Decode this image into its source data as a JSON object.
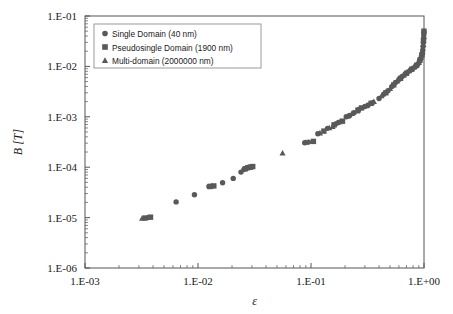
{
  "chart_data": {
    "type": "scatter",
    "title": "",
    "xlabel": "ε",
    "ylabel": "B [T]",
    "xscale": "log",
    "yscale": "log",
    "xlim": [
      0.001,
      1
    ],
    "ylim": [
      1e-06,
      0.1
    ],
    "xticklabels": [
      "1.E-03",
      "1.E-02",
      "1.E-01",
      "1.E+00"
    ],
    "xtickvalues": [
      0.001,
      0.01,
      0.1,
      1
    ],
    "yticklabels": [
      "1.E-01",
      "1.E-02",
      "1.E-03",
      "1.E-04",
      "1.E-05",
      "1.E-06"
    ],
    "ytickvalues": [
      0.1,
      0.01,
      0.001,
      0.0001,
      1e-05,
      1e-06
    ],
    "grid": false,
    "minor_ticks": true,
    "legend_position": "top-left",
    "marker_color": "#595959",
    "frame_color": "#555555",
    "background": "#ffffff",
    "series": [
      {
        "name": "Single Domain (40 nm)",
        "marker": "circle",
        "points": [
          [
            0.0036,
            1e-05
          ],
          [
            0.0064,
            2.05e-05
          ],
          [
            0.0093,
            2.85e-05
          ],
          [
            0.0125,
            4.15e-05
          ],
          [
            0.0132,
            4.2e-05
          ],
          [
            0.0165,
            4.9e-05
          ],
          [
            0.0205,
            6e-05
          ],
          [
            0.024,
            8e-05
          ],
          [
            0.0255,
            9e-05
          ],
          [
            0.027,
            9.6e-05
          ],
          [
            0.0285,
            0.0001
          ],
          [
            0.03,
            0.000102
          ],
          [
            0.088,
            0.000305
          ],
          [
            0.095,
            0.000315
          ],
          [
            0.115,
            0.00046
          ],
          [
            0.14,
            0.00059
          ],
          [
            0.165,
            0.00072
          ],
          [
            0.175,
            0.00077
          ],
          [
            0.205,
            0.001
          ],
          [
            0.22,
            0.00106
          ],
          [
            0.24,
            0.0012
          ],
          [
            0.265,
            0.0014
          ],
          [
            0.3,
            0.0016
          ],
          [
            0.32,
            0.0017
          ],
          [
            0.35,
            0.0019
          ],
          [
            0.4,
            0.0023
          ],
          [
            0.44,
            0.0028
          ],
          [
            0.48,
            0.0033
          ],
          [
            0.52,
            0.004
          ],
          [
            0.56,
            0.0048
          ],
          [
            0.6,
            0.0055
          ],
          [
            0.64,
            0.0063
          ],
          [
            0.68,
            0.007
          ],
          [
            0.72,
            0.0078
          ],
          [
            0.76,
            0.0085
          ],
          [
            0.8,
            0.0092
          ],
          [
            0.84,
            0.01
          ],
          [
            0.88,
            0.011
          ],
          [
            0.91,
            0.0125
          ],
          [
            0.93,
            0.014
          ],
          [
            0.95,
            0.016
          ],
          [
            0.965,
            0.018
          ],
          [
            0.975,
            0.021
          ],
          [
            0.982,
            0.025
          ],
          [
            0.988,
            0.03
          ],
          [
            0.993,
            0.036
          ],
          [
            0.996,
            0.042
          ],
          [
            0.998,
            0.047
          ]
        ]
      },
      {
        "name": "Pseudosingle Domain (1900 nm)",
        "marker": "square",
        "points": [
          [
            0.0034,
            9.8e-06
          ],
          [
            0.0038,
            1.02e-05
          ],
          [
            0.0128,
            4.15e-05
          ],
          [
            0.0138,
            4.25e-05
          ],
          [
            0.0262,
            9.3e-05
          ],
          [
            0.0275,
            9.75e-05
          ],
          [
            0.029,
            0.0001
          ],
          [
            0.0305,
            0.000103
          ],
          [
            0.105,
            0.000325
          ],
          [
            0.13,
            0.00052
          ],
          [
            0.16,
            0.00069
          ],
          [
            0.19,
            0.00082
          ],
          [
            0.26,
            0.00135
          ],
          [
            0.28,
            0.0015
          ],
          [
            0.34,
            0.00185
          ],
          [
            0.46,
            0.003
          ],
          [
            0.54,
            0.0043
          ],
          [
            0.62,
            0.0058
          ],
          [
            0.7,
            0.0073
          ],
          [
            0.78,
            0.0088
          ],
          [
            0.86,
            0.0105
          ],
          [
            0.92,
            0.0132
          ],
          [
            0.96,
            0.017
          ],
          [
            0.99,
            0.032
          ],
          [
            0.999,
            0.05
          ]
        ]
      },
      {
        "name": "Multi-domain (2000000 nm)",
        "marker": "triangle",
        "points": [
          [
            0.0032,
            9.6e-06
          ],
          [
            0.056,
            0.00019
          ],
          [
            0.09,
            0.00031
          ],
          [
            0.12,
            0.000475
          ],
          [
            0.145,
            0.0006
          ],
          [
            0.155,
            0.00064
          ],
          [
            0.18,
            0.00079
          ],
          [
            0.21,
            0.00102
          ],
          [
            0.23,
            0.00115
          ],
          [
            0.255,
            0.0013
          ],
          [
            0.31,
            0.00165
          ],
          [
            0.36,
            0.002
          ],
          [
            0.42,
            0.0026
          ],
          [
            0.5,
            0.0036
          ],
          [
            0.58,
            0.0051
          ],
          [
            0.66,
            0.0066
          ],
          [
            0.74,
            0.0081
          ],
          [
            0.82,
            0.0097
          ],
          [
            0.9,
            0.0118
          ],
          [
            0.94,
            0.015
          ],
          [
            0.97,
            0.0195
          ],
          [
            0.985,
            0.027
          ],
          [
            0.995,
            0.04
          ]
        ]
      }
    ]
  },
  "legend": {
    "entries": [
      {
        "label": "Single Domain (40 nm)",
        "marker": "circle"
      },
      {
        "label": "Pseudosingle Domain (1900 nm)",
        "marker": "square"
      },
      {
        "label": "Multi-domain (2000000 nm)",
        "marker": "triangle"
      }
    ]
  }
}
